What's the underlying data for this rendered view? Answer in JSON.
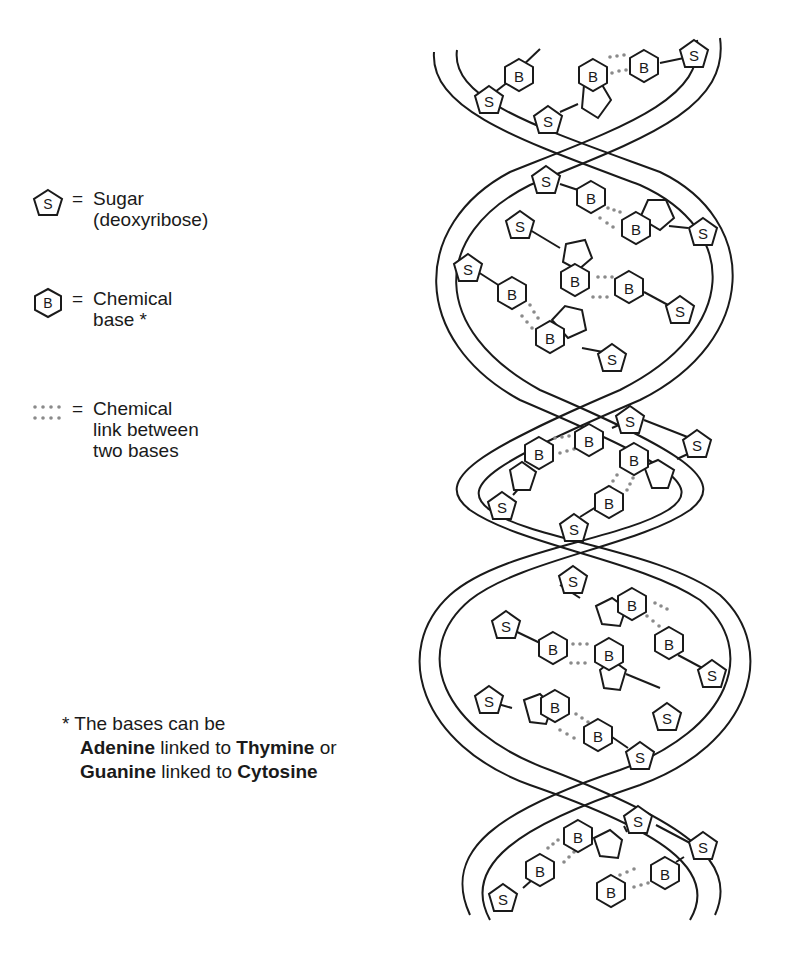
{
  "legend": {
    "items": [
      {
        "icon": "pentagon-S",
        "symbol": "S",
        "equals": "=",
        "lines": [
          "Sugar",
          "(deoxyribose)"
        ]
      },
      {
        "icon": "hexagon-B",
        "symbol": "B",
        "equals": "=",
        "lines": [
          "Chemical",
          "base *"
        ]
      },
      {
        "icon": "dotted-link",
        "symbol": "",
        "equals": "=",
        "lines": [
          "Chemical",
          "link between",
          "two bases"
        ]
      }
    ]
  },
  "footnote": {
    "line1": "* The bases can be",
    "pair1": {
      "a": "Adenine",
      "mid": " linked to ",
      "b": "Thymine",
      "tail": " or"
    },
    "pair2": {
      "a": "Guanine",
      "mid": " linked to ",
      "b": "Cytosine",
      "tail": ""
    }
  },
  "diagram": {
    "sugar_label": "S",
    "base_label": "B",
    "stroke_color": "#1a1a1a",
    "link_color": "#8a8a8a"
  }
}
